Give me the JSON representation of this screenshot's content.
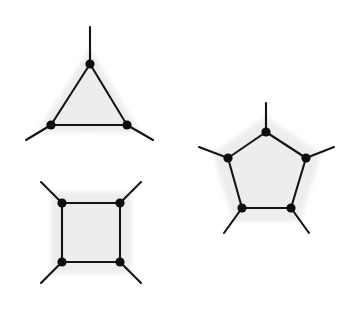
{
  "figure": {
    "background_color": "#ffffff",
    "width": 344,
    "height": 312,
    "ink_color": "#141414",
    "vertex_color": "#0d0d0d",
    "halo_color": "#ededed",
    "halo_opacity": 0.9,
    "edge_width": 2.1,
    "vertex_radius": 4.6,
    "halo_expand_px": 16
  },
  "chart_data": {
    "type": "diagram",
    "shapes": [
      {
        "name": "triangle",
        "label": "3-cycle",
        "sides": 3,
        "vertex_count": 3,
        "edge_count": 3,
        "pendant_count": 3,
        "degree_per_vertex": 3,
        "center": [
          89.5,
          104.5
        ],
        "circumradius": 41.5,
        "rotation_deg": -90,
        "stub_length": 28,
        "vertices": [
          [
            90,
            64
          ],
          [
            127,
            125
          ],
          [
            51,
            125
          ]
        ],
        "stub_ends": [
          [
            90,
            27
          ],
          [
            153,
            140
          ],
          [
            26,
            140
          ]
        ]
      },
      {
        "name": "square",
        "label": "4-cycle",
        "sides": 4,
        "vertex_count": 4,
        "edge_count": 4,
        "pendant_count": 4,
        "degree_per_vertex": 3,
        "center": [
          91,
          232.5
        ],
        "circumradius": 41.5,
        "rotation_deg": -135,
        "stub_length": 28,
        "vertices": [
          [
            62,
            203
          ],
          [
            120,
            203
          ],
          [
            120,
            262
          ],
          [
            62,
            262
          ]
        ],
        "stub_ends": [
          [
            41,
            182
          ],
          [
            141,
            182
          ],
          [
            141,
            283
          ],
          [
            41,
            283
          ]
        ]
      },
      {
        "name": "pentagon",
        "label": "5-cycle",
        "sides": 5,
        "vertex_count": 5,
        "edge_count": 5,
        "pendant_count": 5,
        "degree_per_vertex": 3,
        "center": [
          266.5,
          171
        ],
        "circumradius": 40,
        "rotation_deg": -90,
        "stub_length": 28,
        "vertices": [
          [
            266,
            132
          ],
          [
            306,
            158
          ],
          [
            291,
            208
          ],
          [
            242,
            208
          ],
          [
            228,
            158
          ]
        ],
        "stub_ends": [
          [
            266,
            103
          ],
          [
            334,
            147
          ],
          [
            309,
            233
          ],
          [
            224,
            233
          ],
          [
            199,
            147
          ]
        ]
      }
    ]
  }
}
